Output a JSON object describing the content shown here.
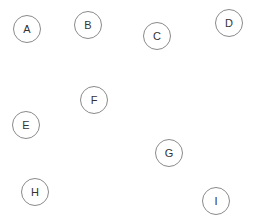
{
  "diagram": {
    "nodes": [
      {
        "label": "A",
        "x": 27,
        "y": 29
      },
      {
        "label": "B",
        "x": 88,
        "y": 25
      },
      {
        "label": "C",
        "x": 157,
        "y": 36
      },
      {
        "label": "D",
        "x": 229,
        "y": 23
      },
      {
        "label": "E",
        "x": 26,
        "y": 125
      },
      {
        "label": "F",
        "x": 94,
        "y": 100
      },
      {
        "label": "G",
        "x": 169,
        "y": 153
      },
      {
        "label": "H",
        "x": 35,
        "y": 192
      },
      {
        "label": "I",
        "x": 216,
        "y": 201
      }
    ],
    "colors": {
      "stroke": "#8a8a8a",
      "text": "#333333",
      "background": "#ffffff"
    }
  }
}
